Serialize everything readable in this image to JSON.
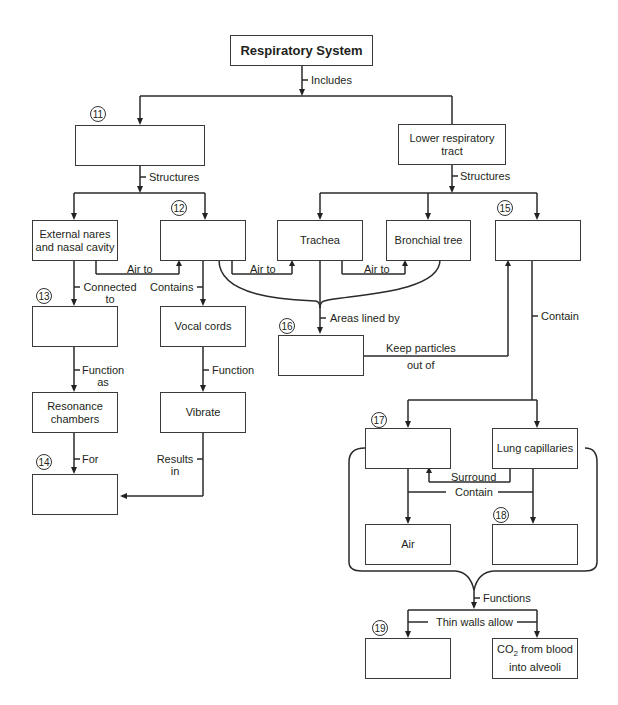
{
  "diagram": {
    "title": "Respiratory System",
    "nodes": {
      "n11": {
        "number": "11",
        "text": ""
      },
      "lower_tract": {
        "text": "Lower respiratory tract"
      },
      "external_nares": {
        "text": "External nares and nasal cavity"
      },
      "n12": {
        "number": "12",
        "text": ""
      },
      "trachea": {
        "text": "Trachea"
      },
      "bronchial_tree": {
        "text": "Bronchial tree"
      },
      "n15": {
        "number": "15",
        "text": ""
      },
      "n13": {
        "number": "13",
        "text": ""
      },
      "vocal_cords": {
        "text": "Vocal cords"
      },
      "n16": {
        "number": "16",
        "text": ""
      },
      "resonance": {
        "text": "Resonance chambers"
      },
      "vibrate": {
        "text": "Vibrate"
      },
      "n14": {
        "number": "14",
        "text": ""
      },
      "n17": {
        "number": "17",
        "text": ""
      },
      "lung_capillaries": {
        "text": "Lung capillaries"
      },
      "air": {
        "text": "Air"
      },
      "n18": {
        "number": "18",
        "text": ""
      },
      "n19": {
        "number": "19",
        "text": ""
      },
      "co2_pre": "CO",
      "co2_sub": "2",
      "co2_post": " from blood into alveoli"
    },
    "edges": {
      "includes": "Includes",
      "structures_left": "Structures",
      "structures_right": "Structures",
      "air_to_1": "Air to",
      "air_to_2": "Air to",
      "air_to_3": "Air to",
      "connected_to": "Connected to",
      "contains": "Contains",
      "areas_lined_by": "Areas lined by",
      "keep_particles": "Keep particles",
      "out_of": "out of",
      "contain_right": "Contain",
      "function_as": "Function as",
      "function": "Function",
      "for": "For",
      "results_in": "Results in",
      "surround": "Surround",
      "contain_lower": "Contain",
      "functions": "Functions",
      "thin_walls_allow": "Thin walls allow"
    }
  }
}
